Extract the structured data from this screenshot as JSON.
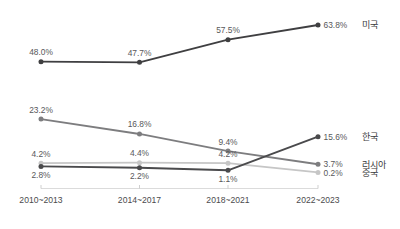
{
  "chart_data": {
    "type": "line",
    "title": "",
    "subtitle": "",
    "xlabel": "",
    "ylabel": "",
    "grid": false,
    "legend_position": "right-inline-end-of-line",
    "categories": [
      "2010~2013",
      "2014~2017",
      "2018~2021",
      "2022~2023"
    ],
    "ylim": [
      0,
      70
    ],
    "series": [
      {
        "name": "미국",
        "color": "#3f3f41",
        "values": [
          48.0,
          47.7,
          57.5,
          63.8
        ],
        "labels": [
          "48.0%",
          "47.7%",
          "57.5%",
          "63.8%"
        ],
        "label_positions": [
          "above",
          "above",
          "above",
          "right"
        ]
      },
      {
        "name": "러시아",
        "color": "#7d7d7f",
        "values": [
          23.2,
          16.8,
          9.4,
          3.7
        ],
        "labels": [
          "23.2%",
          "16.8%",
          "9.4%",
          "3.7%"
        ],
        "label_positions": [
          "above",
          "above",
          "above",
          "right"
        ]
      },
      {
        "name": "중국",
        "color": "#c6c6c6",
        "values": [
          4.2,
          4.4,
          4.2,
          0.2
        ],
        "labels": [
          "4.2%",
          "4.4%",
          "4.2%",
          "0.2%"
        ],
        "label_positions": [
          "above",
          "above",
          "above",
          "right"
        ]
      },
      {
        "name": "한국",
        "color": "#4a4a4c",
        "values": [
          2.8,
          2.2,
          1.1,
          15.6
        ],
        "labels": [
          "2.8%",
          "2.2%",
          "1.1%",
          "15.6%"
        ],
        "label_positions": [
          "below",
          "below",
          "below",
          "right"
        ]
      }
    ],
    "axis_color": "#d7d7d7",
    "label_color": "#58585a",
    "background": "#ffffff"
  },
  "a11y": {
    "chart_role": "line-chart",
    "description": ""
  }
}
